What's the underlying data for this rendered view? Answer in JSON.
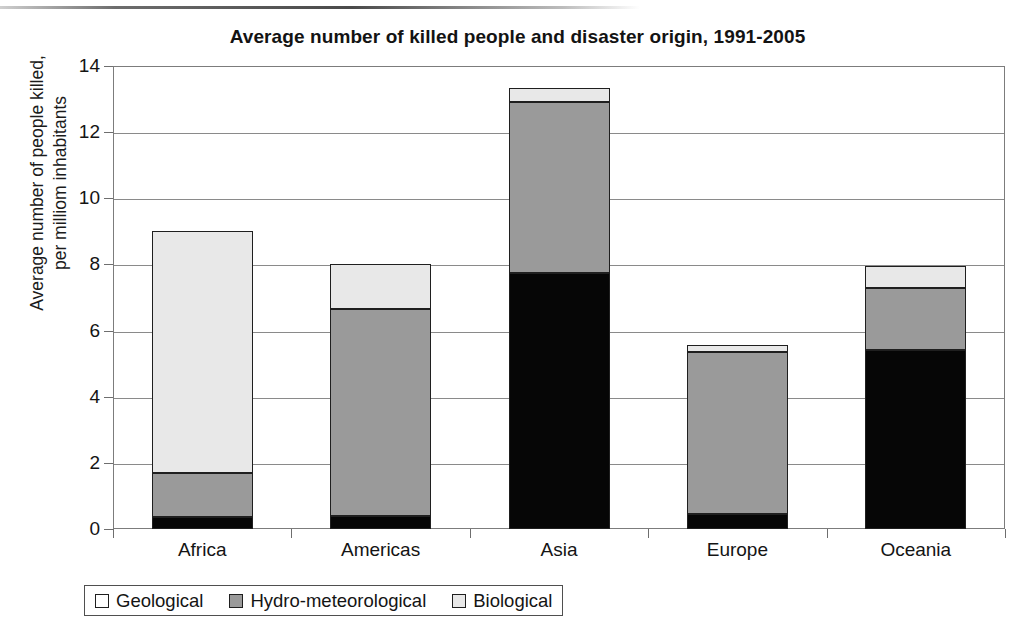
{
  "chart_data": {
    "type": "bar",
    "subtype": "stacked-column",
    "title": "Average number of killed people and disaster origin, 1991-2005",
    "xlabel": "",
    "ylabel": "Average number of people killed, per milliom inhabitants",
    "ylabel_lines": [
      "Average number of people killed,",
      "per milliom inhabitants"
    ],
    "categories": [
      "Africa",
      "Americas",
      "Asia",
      "Europe",
      "Oceania"
    ],
    "ylim": [
      0,
      14
    ],
    "yticks": [
      0,
      2,
      4,
      6,
      8,
      10,
      12,
      14
    ],
    "ytick_labels": [
      "0",
      "2",
      "4",
      "6",
      "8",
      "10",
      "12",
      "14"
    ],
    "grid": true,
    "legend_position": "bottom",
    "series": [
      {
        "name": "Geological",
        "color": "#060606",
        "values": [
          0.35,
          0.4,
          7.75,
          0.45,
          5.4
        ]
      },
      {
        "name": "Hydro-meteorological",
        "color": "#9a9a9a",
        "values": [
          1.35,
          6.25,
          5.15,
          4.9,
          1.9
        ]
      },
      {
        "name": "Biological",
        "color": "#e8e8e8",
        "values": [
          7.3,
          1.35,
          0.45,
          0.2,
          0.65
        ]
      }
    ],
    "totals": [
      9.0,
      8.0,
      13.35,
      5.55,
      7.95
    ]
  },
  "legend": {
    "items": [
      {
        "label": "Geological",
        "swatch": "geological"
      },
      {
        "label": "Hydro-meteorological",
        "swatch": "hydro"
      },
      {
        "label": "Biological",
        "swatch": "biological"
      }
    ]
  }
}
